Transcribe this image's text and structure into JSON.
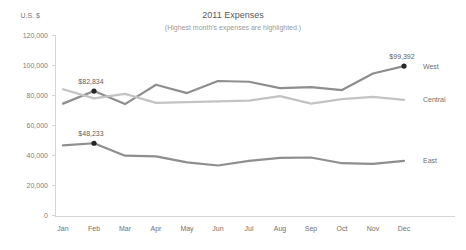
{
  "chart_data": {
    "type": "line",
    "title": "2011 Expenses",
    "subtitle": "(Highest month's expenses are highlighted.)",
    "ylabel": "U.S. $",
    "xlabel": "",
    "categories": [
      "Jan",
      "Feb",
      "Mar",
      "Apr",
      "May",
      "Jun",
      "Jul",
      "Aug",
      "Sep",
      "Oct",
      "Nov",
      "Dec"
    ],
    "ylim": [
      0,
      120000
    ],
    "ytick_values": [
      0,
      20000,
      40000,
      60000,
      80000,
      100000,
      120000
    ],
    "ytick_labels": [
      "0",
      "20,000",
      "40,000",
      "60,000",
      "80,000",
      "100,000",
      "120,000"
    ],
    "grid": false,
    "legend_position": "right",
    "series": [
      {
        "name": "West",
        "color": "#8e8e8e",
        "values": [
          74500,
          82834,
          74200,
          87000,
          81500,
          89500,
          89000,
          84800,
          85500,
          83500,
          94500,
          99392
        ],
        "highlight": {
          "index": 11,
          "label": "$99,392",
          "value": 99392
        }
      },
      {
        "name": "Central",
        "color": "#c3c3c3",
        "values": [
          84000,
          78000,
          81000,
          75000,
          75500,
          76000,
          76500,
          79500,
          74500,
          77500,
          79000,
          77000
        ],
        "highlight": null
      },
      {
        "name": "East",
        "color": "#8e8e8e",
        "values": [
          46800,
          48233,
          40000,
          39500,
          35500,
          33500,
          36500,
          38500,
          38800,
          35000,
          34500,
          36500
        ],
        "highlight": {
          "index": 1,
          "label": "$48,233",
          "value": 48233
        }
      }
    ],
    "highlight_annotations": [
      {
        "series": "West",
        "month": "Feb",
        "label": "$82,834",
        "value": 82834
      }
    ]
  },
  "legend": {
    "items": [
      {
        "label": "West"
      },
      {
        "label": "Central"
      },
      {
        "label": "East"
      }
    ]
  },
  "labels": {
    "west_peak": "$99,392",
    "west_feb": "$82,834",
    "east_feb": "$48,233"
  }
}
